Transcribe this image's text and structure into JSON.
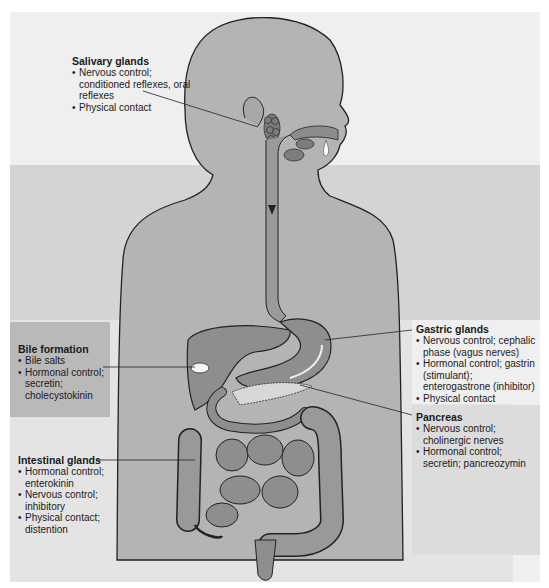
{
  "figure": {
    "colors": {
      "background": "#ffffff",
      "top_band": "#efefef",
      "mid_band": "#d4d4d4",
      "low_band": "#e4e4e4",
      "bile_panel": "#b9b9b9",
      "pancreas_panel": "#dcdcdc",
      "body_fill": "#b4b4b4",
      "organ_fill": "#8e8e8e",
      "outline": "#222222"
    }
  },
  "labels": {
    "salivary": {
      "title": "Salivary glands",
      "items": [
        "Nervous control; conditioned reflexes, oral reflexes",
        "Physical contact"
      ]
    },
    "bile": {
      "title": "Bile formation",
      "items": [
        "Bile salts",
        "Hormonal control; secretin; cholecystokinin"
      ]
    },
    "gastric": {
      "title": "Gastric glands",
      "items": [
        "Nervous control; cephalic phase (vagus nerves)",
        "Hormonal control; gastrin (stimulant); enterogastrone (inhibitor)",
        "Physical contact"
      ]
    },
    "pancreas": {
      "title": "Pancreas",
      "items": [
        "Nervous control; cholinergic nerves",
        "Hormonal control; secretin; pancreozymin"
      ]
    },
    "intestinal": {
      "title": "Intestinal glands",
      "items": [
        "Hormonal control; enterokinin",
        "Nervous control; inhibitory",
        "Physical contact; distention"
      ]
    }
  }
}
